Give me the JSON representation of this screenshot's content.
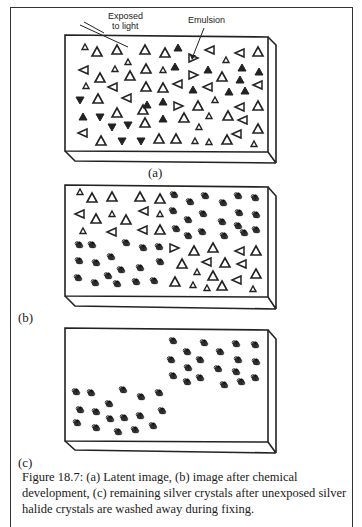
{
  "figure": {
    "annotations": {
      "exposed_line1": "Exposed",
      "exposed_line2": "to light",
      "emulsion": "Emulsion"
    },
    "panels": [
      {
        "label": "(a)",
        "description": "Latent image: all crystals are silver halide triangles; exposed ones shaded"
      },
      {
        "label": "(b)",
        "description": "After development: exposed region crystals become silver clusters"
      },
      {
        "label": "(c)",
        "description": "After fixing: only silver clusters remain"
      }
    ],
    "caption": "Figure 18.7:  (a)  Latent image, (b)  image after chemical development, (c)  remaining silver crystals after unexposed silver halide crystals are washed away during fixing."
  }
}
